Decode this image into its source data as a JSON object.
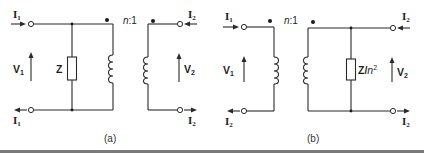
{
  "figure": {
    "panels": [
      {
        "id": "a",
        "caption": "(a)",
        "turns_ratio": "n:1",
        "ratio_n": "n",
        "ratio_rest": ":1",
        "impedance": {
          "label": "Z",
          "position": "primary-shunt"
        },
        "labels": {
          "top_left_current": {
            "main": "I",
            "sub": "1"
          },
          "bottom_left_current": {
            "main": "I",
            "sub": "1"
          },
          "top_right_current": {
            "main": "I",
            "sub": "2"
          },
          "bottom_right_current": {
            "main": "I",
            "sub": "2"
          },
          "primary_voltage": {
            "main": "V",
            "sub": "1"
          },
          "secondary_voltage": {
            "main": "V",
            "sub": "2"
          }
        }
      },
      {
        "id": "b",
        "caption": "(b)",
        "turns_ratio": "n:1",
        "ratio_n": "n",
        "ratio_rest": ":1",
        "impedance": {
          "label": "Z/",
          "label_n": "n",
          "label_exp": "2",
          "position": "secondary-shunt"
        },
        "labels": {
          "top_left_current": {
            "main": "I",
            "sub": "1"
          },
          "bottom_left_current": {
            "main": "I",
            "sub": "2"
          },
          "top_right_current": {
            "main": "I",
            "sub": "2"
          },
          "bottom_right_current": {
            "main": "I",
            "sub": "2"
          },
          "primary_voltage": {
            "main": "V",
            "sub": "1"
          },
          "secondary_voltage": {
            "main": "V",
            "sub": "2"
          }
        }
      }
    ],
    "colors": {
      "line": "#2a2a2a",
      "rule": "#7a7a7a",
      "background": "#ffffff"
    }
  }
}
